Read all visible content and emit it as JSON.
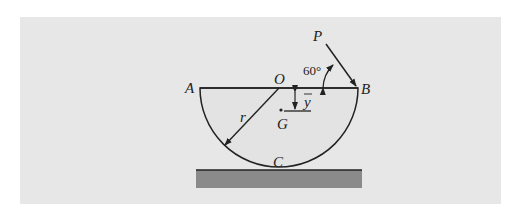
{
  "figure": {
    "labels": {
      "A": "A",
      "B": "B",
      "O": "O",
      "P": "P",
      "G": "G",
      "C": "C",
      "r": "r",
      "ybar": "y",
      "angle": "60°"
    },
    "angle_deg": 60
  }
}
